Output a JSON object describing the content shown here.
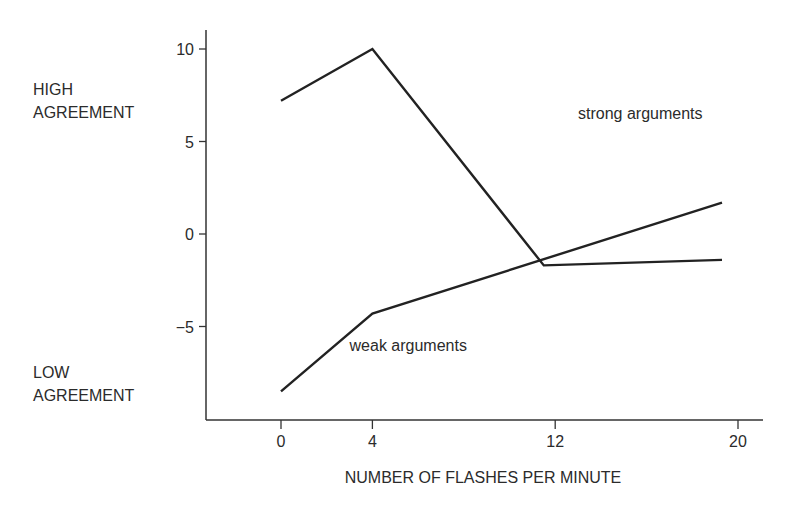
{
  "chart_data": {
    "type": "line",
    "title": "",
    "xlabel": "NUMBER OF FLASHES PER MINUTE",
    "ylabel": "",
    "y_annotations": {
      "high": [
        "HIGH",
        "AGREEMENT"
      ],
      "low": [
        "LOW",
        "AGREEMENT"
      ]
    },
    "x_ticks": [
      0,
      4,
      12,
      20
    ],
    "y_ticks": [
      10,
      5,
      0,
      -5
    ],
    "y_tick_labels": [
      "10",
      "5",
      "0",
      "−5"
    ],
    "xlim": [
      -3.2,
      21.1
    ],
    "ylim": [
      -10,
      11
    ],
    "grid": false,
    "legend": "inline labels",
    "series": [
      {
        "name": "strong arguments",
        "points": [
          [
            0,
            7.2
          ],
          [
            4,
            10.0
          ],
          [
            11.5,
            -1.7
          ],
          [
            19.3,
            -1.4
          ]
        ],
        "label_position": [
          13.0,
          6.2
        ]
      },
      {
        "name": "weak arguments",
        "points": [
          [
            0,
            -8.5
          ],
          [
            4,
            -4.3
          ],
          [
            19.3,
            1.7
          ]
        ],
        "label_position": [
          3.0,
          -6.3
        ]
      }
    ]
  }
}
